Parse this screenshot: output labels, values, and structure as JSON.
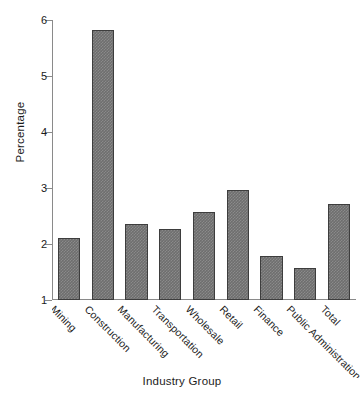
{
  "chart_data": {
    "type": "bar",
    "title": "",
    "xlabel": "Industry Group",
    "ylabel": "Percentage",
    "categories": [
      "Mining",
      "Construction",
      "Manufacturing",
      "Transportation",
      "Wholesale",
      "Retail",
      "Finance",
      "Public Administration",
      "Total"
    ],
    "values": [
      2.11,
      5.82,
      2.35,
      2.27,
      2.58,
      2.96,
      1.79,
      1.58,
      2.72
    ],
    "ylim": [
      1,
      6
    ],
    "yticks": [
      1,
      2,
      3,
      4,
      5,
      6
    ],
    "ytick_labels": [
      "1",
      "2",
      "3",
      "4",
      "5",
      "6"
    ],
    "grid": false,
    "legend": false,
    "bar_color": "#6e6e6e",
    "bar_edge_color": "#3d3d3d",
    "axis_color": "#8a8a8a",
    "background": "#ffffff"
  }
}
